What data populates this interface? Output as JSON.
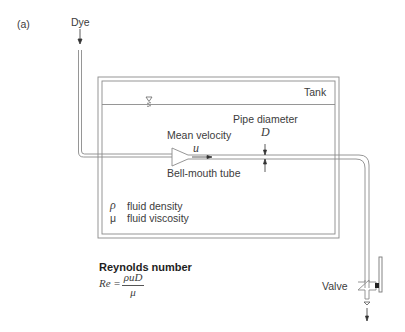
{
  "figure": {
    "panel_label": "(a)",
    "labels": {
      "dye": "Dye",
      "tank": "Tank",
      "pipe_diameter": "Pipe diameter",
      "diameter_symbol": "D",
      "mean_velocity": "Mean velocity",
      "velocity_symbol": "u",
      "bell_mouth": "Bell-mouth tube",
      "valve": "Valve"
    },
    "legend": [
      {
        "symbol": "ρ",
        "text": "fluid density"
      },
      {
        "symbol": "μ",
        "text": "fluid viscosity"
      }
    ],
    "formula": {
      "title": "Reynolds number",
      "lhs": "Re =",
      "numerator": "ρuD",
      "denominator": "μ"
    },
    "colors": {
      "line": "#7a7a7a",
      "dark": "#333333",
      "background": "#ffffff"
    }
  }
}
